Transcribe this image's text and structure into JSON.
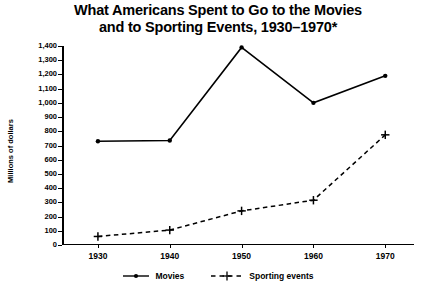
{
  "chart_data": {
    "type": "line",
    "title": "What Americans Spent to Go to the Movies and to Sporting Events, 1930–1970*",
    "title_lines": [
      "What Americans Spent to Go to the Movies",
      "and to Sporting Events, 1930–1970*"
    ],
    "xlabel": "",
    "ylabel": "Millions of dollars",
    "x": [
      1930,
      1940,
      1950,
      1960,
      1970
    ],
    "categories": [
      "1930",
      "1940",
      "1950",
      "1960",
      "1970"
    ],
    "xtick_labels": [
      "1930",
      "1940",
      "1950",
      "1960",
      "1970"
    ],
    "ytick_labels": [
      "0",
      "100",
      "200",
      "300",
      "400",
      "500",
      "600",
      "700",
      "800",
      "900",
      "1,000",
      "1,100",
      "1,200",
      "1,300",
      "1,400"
    ],
    "ytick_values": [
      0,
      100,
      200,
      300,
      400,
      500,
      600,
      700,
      800,
      900,
      1000,
      1100,
      1200,
      1300,
      1400
    ],
    "ylim": [
      0,
      1400
    ],
    "xlim": [
      1925,
      1974
    ],
    "grid": false,
    "legend_position": "bottom",
    "series": [
      {
        "name": "Movies",
        "values": [
          730,
          735,
          1390,
          1000,
          1190
        ],
        "line_style": "solid",
        "marker": "dot",
        "color": "#000000"
      },
      {
        "name": "Sporting events",
        "values": [
          60,
          105,
          240,
          315,
          775
        ],
        "line_style": "dashed",
        "marker": "plus",
        "color": "#000000"
      }
    ]
  },
  "legend": {
    "items": [
      {
        "label": "Movies",
        "style": "solid-dot"
      },
      {
        "label": "Sporting events",
        "style": "dashed-plus"
      }
    ]
  },
  "colors": {
    "background": "#ffffff",
    "ink": "#000000"
  }
}
